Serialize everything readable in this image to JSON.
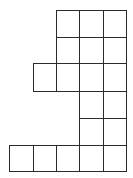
{
  "figure": {
    "type": "grid-polyomino",
    "line_color": "#2a2a2a",
    "background": "#ffffff",
    "columns": 5,
    "rows": 6,
    "col_edges": [
      9,
      33,
      56,
      79,
      103,
      126
    ],
    "row_edges": [
      10,
      37,
      63,
      91,
      118,
      145,
      171
    ],
    "cells": [
      {
        "row": 0,
        "col": 2
      },
      {
        "row": 0,
        "col": 3
      },
      {
        "row": 0,
        "col": 4
      },
      {
        "row": 1,
        "col": 2
      },
      {
        "row": 1,
        "col": 3
      },
      {
        "row": 1,
        "col": 4
      },
      {
        "row": 2,
        "col": 1
      },
      {
        "row": 2,
        "col": 2
      },
      {
        "row": 2,
        "col": 3
      },
      {
        "row": 2,
        "col": 4
      },
      {
        "row": 3,
        "col": 3
      },
      {
        "row": 3,
        "col": 4
      },
      {
        "row": 4,
        "col": 3
      },
      {
        "row": 4,
        "col": 4
      },
      {
        "row": 5,
        "col": 0
      },
      {
        "row": 5,
        "col": 1
      },
      {
        "row": 5,
        "col": 2
      },
      {
        "row": 5,
        "col": 3
      },
      {
        "row": 5,
        "col": 4
      }
    ],
    "cell_count": 19
  }
}
